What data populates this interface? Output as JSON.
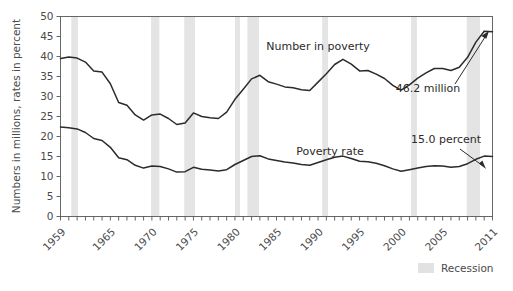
{
  "chart_data": {
    "type": "line",
    "title": "",
    "xlabel": "",
    "ylabel": "Numbers in millions, rates in percent",
    "xlim": [
      1959,
      2011
    ],
    "ylim": [
      0,
      50
    ],
    "grid": false,
    "legend_position": "bottom-right",
    "y_ticks": [
      "0",
      "5",
      "10",
      "15",
      "20",
      "25",
      "30",
      "35",
      "40",
      "45",
      "50"
    ],
    "y_tick_values": [
      0,
      5,
      10,
      15,
      20,
      25,
      30,
      35,
      40,
      45,
      50
    ],
    "x_ticks": [
      "1959",
      "1965",
      "1970",
      "1975",
      "1980",
      "1985",
      "1990",
      "1995",
      "2000",
      "2005",
      "2011"
    ],
    "x_tick_values": [
      1959,
      1965,
      1970,
      1975,
      1980,
      1985,
      1990,
      1995,
      2000,
      2005,
      2011
    ],
    "x_minor_step": 1,
    "series": [
      {
        "name": "Number in poverty",
        "unit": "millions",
        "label_text": "Number in poverty",
        "x": [
          1959,
          1960,
          1961,
          1962,
          1963,
          1964,
          1965,
          1966,
          1967,
          1968,
          1969,
          1970,
          1971,
          1972,
          1973,
          1974,
          1975,
          1976,
          1977,
          1978,
          1979,
          1980,
          1981,
          1982,
          1983,
          1984,
          1985,
          1986,
          1987,
          1988,
          1989,
          1990,
          1991,
          1992,
          1993,
          1994,
          1995,
          1996,
          1997,
          1998,
          1999,
          2000,
          2001,
          2002,
          2003,
          2004,
          2005,
          2006,
          2007,
          2008,
          2009,
          2010,
          2011
        ],
        "values": [
          39.5,
          39.9,
          39.6,
          38.6,
          36.4,
          36.1,
          33.2,
          28.5,
          27.8,
          25.4,
          24.1,
          25.4,
          25.6,
          24.5,
          23.0,
          23.4,
          25.9,
          25.0,
          24.7,
          24.5,
          26.1,
          29.3,
          31.8,
          34.4,
          35.3,
          33.7,
          33.1,
          32.4,
          32.2,
          31.7,
          31.5,
          33.6,
          35.7,
          38.0,
          39.3,
          38.1,
          36.4,
          36.5,
          35.6,
          34.5,
          32.8,
          31.6,
          32.9,
          34.6,
          35.9,
          37.0,
          37.0,
          36.5,
          37.3,
          39.8,
          43.6,
          46.3,
          46.2
        ],
        "annotation": {
          "text": "46.2 million",
          "x": 2011,
          "y": 46.2
        }
      },
      {
        "name": "Poverty rate",
        "unit": "percent",
        "label_text": "Poverty rate",
        "x": [
          1959,
          1960,
          1961,
          1962,
          1963,
          1964,
          1965,
          1966,
          1967,
          1968,
          1969,
          1970,
          1971,
          1972,
          1973,
          1974,
          1975,
          1976,
          1977,
          1978,
          1979,
          1980,
          1981,
          1982,
          1983,
          1984,
          1985,
          1986,
          1987,
          1988,
          1989,
          1990,
          1991,
          1992,
          1993,
          1994,
          1995,
          1996,
          1997,
          1998,
          1999,
          2000,
          2001,
          2002,
          2003,
          2004,
          2005,
          2006,
          2007,
          2008,
          2009,
          2010,
          2011
        ],
        "values": [
          22.4,
          22.2,
          21.9,
          21.0,
          19.5,
          19.0,
          17.3,
          14.7,
          14.2,
          12.8,
          12.1,
          12.6,
          12.5,
          11.9,
          11.1,
          11.2,
          12.3,
          11.8,
          11.6,
          11.4,
          11.7,
          13.0,
          14.0,
          15.0,
          15.2,
          14.4,
          14.0,
          13.6,
          13.4,
          13.0,
          12.8,
          13.5,
          14.2,
          14.8,
          15.1,
          14.5,
          13.8,
          13.7,
          13.3,
          12.7,
          11.9,
          11.3,
          11.7,
          12.1,
          12.5,
          12.7,
          12.6,
          12.3,
          12.5,
          13.2,
          14.3,
          15.1,
          15.0
        ],
        "annotation": {
          "text": "15.0 percent",
          "x": 2011,
          "y": 15.0
        }
      }
    ],
    "recessions": [
      {
        "start": 1960.3,
        "end": 1961.1
      },
      {
        "start": 1969.9,
        "end": 1970.9
      },
      {
        "start": 1973.9,
        "end": 1975.2
      },
      {
        "start": 1980.0,
        "end": 1980.6
      },
      {
        "start": 1981.5,
        "end": 1982.9
      },
      {
        "start": 1990.5,
        "end": 1991.2
      },
      {
        "start": 2001.2,
        "end": 2001.9
      },
      {
        "start": 2007.9,
        "end": 2009.5
      }
    ],
    "legend": [
      {
        "label": "Recession",
        "swatch_color": "#e2e2e2"
      }
    ],
    "colors": {
      "line": "#2b2b2b",
      "recession_band": "#e4e4e4",
      "axis": "#555555",
      "text": "#4a4a4a"
    }
  }
}
